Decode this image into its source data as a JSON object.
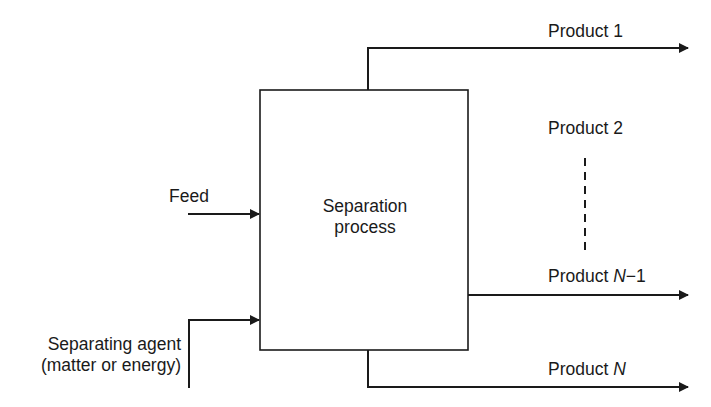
{
  "diagram": {
    "type": "separation-process-flow",
    "process_box": {
      "label_line1": "Separation",
      "label_line2": "process"
    },
    "inputs": [
      {
        "id": "feed",
        "label": "Feed"
      },
      {
        "id": "separating_agent",
        "label_line1": "Separating agent",
        "label_line2": "(matter or energy)"
      }
    ],
    "outputs": [
      {
        "id": "product_1",
        "label_prefix": "Product ",
        "label_var": "",
        "label_suffix": "1"
      },
      {
        "id": "product_2",
        "label_prefix": "Product ",
        "label_var": "",
        "label_suffix": "2"
      },
      {
        "id": "product_n_minus_1",
        "label_prefix": "Product ",
        "label_var": "N",
        "label_suffix": "−1"
      },
      {
        "id": "product_n",
        "label_prefix": "Product ",
        "label_var": "N",
        "label_suffix": ""
      }
    ],
    "ellipsis_connector": "dashed-vertical-line",
    "colors": {
      "line": "#1a1a1a",
      "background": "#ffffff"
    }
  }
}
